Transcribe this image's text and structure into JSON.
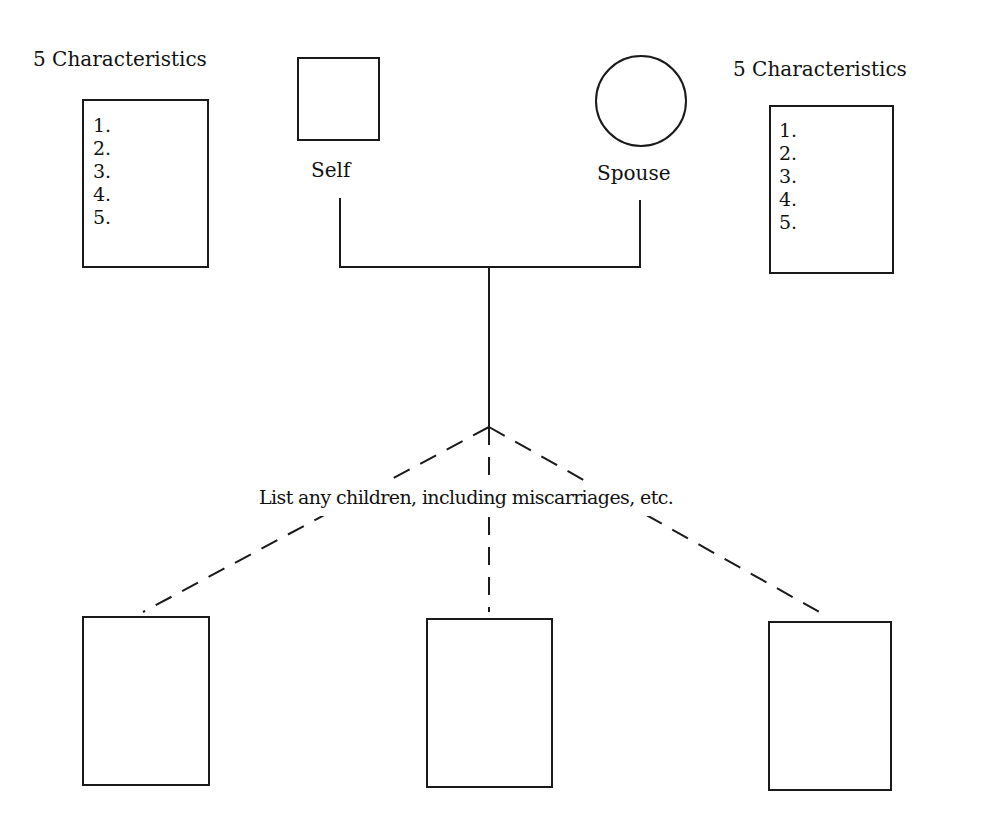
{
  "diagram": {
    "type": "genogram-worksheet",
    "left_person": {
      "heading": "5 Characteristics",
      "symbol": "square",
      "label": "Self",
      "characteristics": [
        "1.",
        "2.",
        "3.",
        "4.",
        "5."
      ]
    },
    "right_person": {
      "heading": "5 Characteristics",
      "symbol": "circle",
      "label": "Spouse",
      "characteristics": [
        "1.",
        "2.",
        "3.",
        "4.",
        "5."
      ]
    },
    "children_caption": "List any children, including miscarriages, etc.",
    "children": [
      {
        "symbol": "rectangle",
        "label": ""
      },
      {
        "symbol": "rectangle",
        "label": ""
      },
      {
        "symbol": "rectangle",
        "label": ""
      }
    ],
    "colors": {
      "stroke": "#1a1a1a",
      "background": "#ffffff",
      "text": "#111111"
    }
  }
}
